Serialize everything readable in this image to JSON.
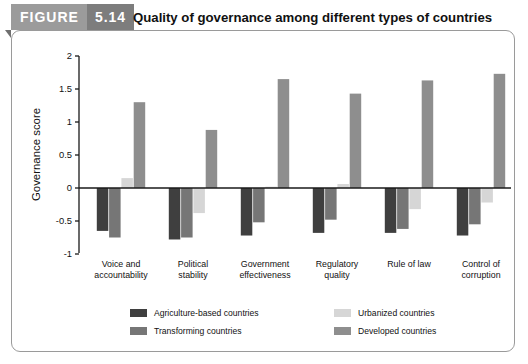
{
  "figure": {
    "label": "FIGURE",
    "number": "5.14",
    "title": "Quality of governance among different types of countries"
  },
  "chart_data": {
    "type": "bar",
    "title": "Quality of governance among different types of countries",
    "xlabel": "",
    "ylabel": "Governance score",
    "ylim": [
      -1,
      2
    ],
    "yticks": [
      -1,
      -0.5,
      0,
      0.5,
      1,
      1.5,
      2
    ],
    "ytick_labels": [
      "-1",
      "-0.5",
      "0",
      "0.5",
      "1",
      "1.5",
      "2"
    ],
    "grid": false,
    "legend_position": "bottom",
    "categories": [
      "Voice and accountability",
      "Political stability",
      "Government effectiveness",
      "Regulatory quality",
      "Rule of law",
      "Control of corruption"
    ],
    "category_lines": [
      [
        "Voice and",
        "accountability"
      ],
      [
        "Political",
        "stability"
      ],
      [
        "Government",
        "effectiveness"
      ],
      [
        "Regulatory",
        "quality"
      ],
      [
        "Rule of law",
        ""
      ],
      [
        "Control of",
        "corruption"
      ]
    ],
    "series": [
      {
        "name": "Agriculture-based countries",
        "color": "#3f3f3f",
        "values": [
          -0.65,
          -0.78,
          -0.72,
          -0.68,
          -0.68,
          -0.72
        ]
      },
      {
        "name": "Transforming countries",
        "color": "#767676",
        "values": [
          -0.75,
          -0.75,
          -0.52,
          -0.48,
          -0.62,
          -0.55
        ]
      },
      {
        "name": "Urbanized countries",
        "color": "#d6d6d6",
        "values": [
          0.15,
          -0.38,
          0.02,
          0.06,
          -0.32,
          -0.22
        ]
      },
      {
        "name": "Developed countries",
        "color": "#8e8e8e",
        "values": [
          1.3,
          0.88,
          1.65,
          1.43,
          1.63,
          1.73
        ]
      }
    ]
  },
  "legend": {
    "items": [
      {
        "label": "Agriculture-based countries",
        "color": "#3f3f3f"
      },
      {
        "label": "Transforming countries",
        "color": "#767676"
      },
      {
        "label": "Urbanized countries",
        "color": "#d6d6d6"
      },
      {
        "label": "Developed countries",
        "color": "#8e8e8e"
      }
    ]
  },
  "colors": {
    "tab_light": "#9b9b9b",
    "tab_dark": "#7d7d7d",
    "panel_border": "#9a9a9a",
    "axis": "#1a1a1a"
  }
}
